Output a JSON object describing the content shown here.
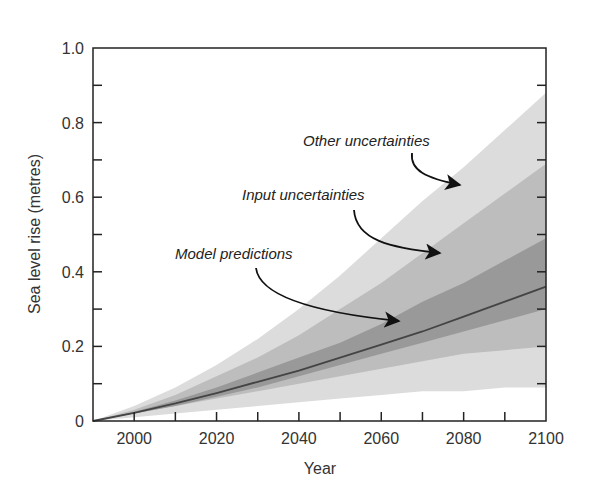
{
  "chart_data": {
    "type": "area",
    "title": "",
    "xlabel": "Year",
    "ylabel": "Sea level rise (metres)",
    "xlim": [
      1990,
      2100
    ],
    "ylim": [
      0,
      1.0
    ],
    "x_ticks": [
      2000,
      2020,
      2040,
      2060,
      2080,
      2100
    ],
    "x_minor_ticks": [
      2000,
      2010,
      2020,
      2030,
      2040,
      2050,
      2060,
      2070,
      2080,
      2090
    ],
    "y_ticks": [
      0,
      0.2,
      0.4,
      0.6,
      0.8,
      1.0
    ],
    "y_tick_labels": [
      "0",
      "0.2",
      "0.4",
      "0.6",
      "0.8",
      "1.0"
    ],
    "y_minor_ticks": [
      0.1,
      0.2,
      0.3,
      0.4,
      0.5,
      0.6,
      0.7,
      0.8,
      0.9
    ],
    "grid": false,
    "legend": "none (inline annotations with arrows)",
    "x": [
      1990,
      2000,
      2010,
      2020,
      2030,
      2040,
      2050,
      2060,
      2070,
      2080,
      2090,
      2100
    ],
    "series": [
      {
        "name": "Other uncertainties",
        "kind": "band",
        "color": "#dcdcdc",
        "upper": [
          0.0,
          0.04,
          0.09,
          0.15,
          0.22,
          0.3,
          0.39,
          0.49,
          0.59,
          0.68,
          0.78,
          0.88
        ],
        "lower": [
          0.0,
          0.01,
          0.02,
          0.03,
          0.04,
          0.05,
          0.06,
          0.07,
          0.08,
          0.08,
          0.09,
          0.09
        ]
      },
      {
        "name": "Input uncertainties",
        "kind": "band",
        "color": "#bdbdbd",
        "upper": [
          0.0,
          0.03,
          0.07,
          0.12,
          0.17,
          0.23,
          0.3,
          0.37,
          0.45,
          0.53,
          0.61,
          0.69
        ],
        "lower": [
          0.0,
          0.02,
          0.04,
          0.06,
          0.08,
          0.1,
          0.12,
          0.14,
          0.16,
          0.18,
          0.19,
          0.2
        ]
      },
      {
        "name": "Model predictions",
        "kind": "band",
        "color": "#999999",
        "upper": [
          0.0,
          0.025,
          0.055,
          0.09,
          0.13,
          0.17,
          0.21,
          0.26,
          0.32,
          0.37,
          0.43,
          0.49
        ],
        "lower": [
          0.0,
          0.02,
          0.04,
          0.065,
          0.09,
          0.12,
          0.15,
          0.18,
          0.21,
          0.24,
          0.27,
          0.3
        ]
      },
      {
        "name": "Central projection",
        "kind": "line",
        "color": "#444444",
        "values": [
          0.0,
          0.022,
          0.047,
          0.075,
          0.105,
          0.135,
          0.17,
          0.205,
          0.24,
          0.28,
          0.32,
          0.36
        ]
      }
    ],
    "annotations": [
      {
        "text": "Other uncertainties",
        "arrow_to": [
          2073,
          0.63
        ]
      },
      {
        "text": "Input uncertainties",
        "arrow_to": [
          2077,
          0.45
        ]
      },
      {
        "text": "Model predictions",
        "arrow_to": [
          2068,
          0.26
        ]
      }
    ]
  }
}
